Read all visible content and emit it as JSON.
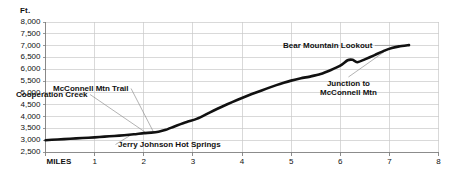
{
  "chart_data": {
    "type": "line",
    "title": "",
    "subtitle": "",
    "xlabel": "MILES",
    "ylabel": "Ft.",
    "xlim": [
      0,
      8
    ],
    "ylim": [
      2500,
      8000
    ],
    "grid": true,
    "legend": null,
    "x_ticks": [
      "MILES",
      "1",
      "2",
      "3",
      "4",
      "5",
      "6",
      "7",
      "8"
    ],
    "x_tick_values": [
      0,
      1,
      2,
      3,
      4,
      5,
      6,
      7,
      8
    ],
    "y_ticks": [
      "2,500",
      "3,000",
      "3,500",
      "4,000",
      "4,500",
      "5,000",
      "5,500",
      "6,000",
      "6,500",
      "7,000",
      "7,500",
      "8,000"
    ],
    "y_tick_values": [
      2500,
      3000,
      3500,
      4000,
      4500,
      5000,
      5500,
      6000,
      6500,
      7000,
      7500,
      8000
    ],
    "series": [
      {
        "name": "Bear Mountain Trail elevation profile",
        "color": "#111111",
        "x": [
          0.0,
          0.25,
          0.5,
          0.75,
          1.0,
          1.2,
          1.4,
          1.6,
          1.8,
          2.0,
          2.15,
          2.3,
          2.45,
          2.6,
          2.75,
          2.9,
          3.05,
          3.2,
          3.35,
          3.5,
          3.7,
          3.9,
          4.1,
          4.3,
          4.5,
          4.7,
          4.85,
          5.0,
          5.2,
          5.4,
          5.6,
          5.8,
          6.0,
          6.15,
          6.25,
          6.35,
          6.5,
          6.7,
          6.9,
          7.05,
          7.2,
          7.4
        ],
        "y": [
          3000,
          3030,
          3060,
          3090,
          3120,
          3150,
          3180,
          3210,
          3250,
          3300,
          3320,
          3360,
          3440,
          3560,
          3680,
          3790,
          3880,
          4020,
          4180,
          4330,
          4520,
          4700,
          4870,
          5030,
          5180,
          5330,
          5430,
          5520,
          5620,
          5700,
          5800,
          5960,
          6150,
          6380,
          6400,
          6300,
          6420,
          6600,
          6790,
          6900,
          6970,
          7020
        ]
      }
    ],
    "annotations": [
      {
        "id": "cooperation-creek",
        "text": "Cooperation Creek",
        "point_x": 2.05,
        "point_y": 3310
      },
      {
        "id": "mcconnell-mtn-trail",
        "text": "McConnell Mtn Trail",
        "point_x": 2.2,
        "point_y": 3340
      },
      {
        "id": "jerry-johnson-hot-springs",
        "text": "Jerry Johnson Hot Springs",
        "point_x": 1.75,
        "point_y": 3235
      },
      {
        "id": "junction-to-mcconnell-mtn",
        "text": "Junction to McConnell Mtn",
        "line1": "Junction to",
        "line2": "McConnell Mtn",
        "point_x": 6.95,
        "point_y": 6820
      },
      {
        "id": "bear-mountain-lookout",
        "text": "Bear Mountain Lookout",
        "point_x": 7.36,
        "point_y": 7015
      }
    ]
  },
  "style": {
    "background": "#ffffff",
    "grid_color": "#c9c9c9",
    "axis_color": "#808080",
    "line_color": "#111111",
    "leader_color": "#8a8a8a",
    "text_color": "#111111"
  }
}
